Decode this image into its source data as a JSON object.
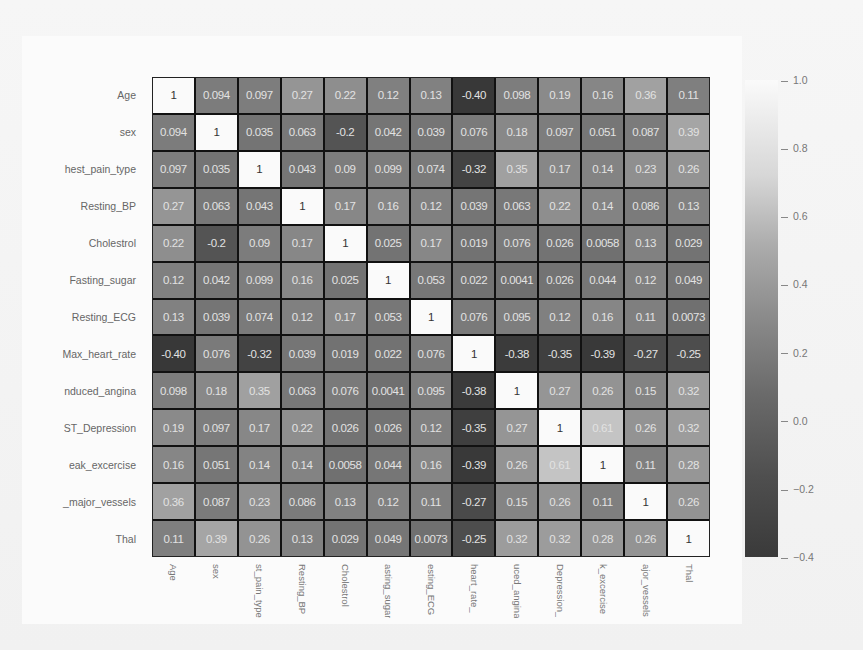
{
  "chart_data": {
    "type": "heatmap",
    "title": "",
    "xlabel": "",
    "ylabel": "",
    "row_labels": [
      "Age",
      "sex",
      "chest_pain_type",
      "Resting_BP",
      "Cholestrol",
      "Fasting_sugar",
      "Resting_ECG",
      "Max_heart_rate",
      "Induced_angina",
      "ST_Depression",
      "Peak_excercise",
      "No_major_vessels",
      "Thal"
    ],
    "row_labels_visible": [
      "Age",
      "sex",
      "hest_pain_type",
      "Resting_BP",
      "Cholestrol",
      "Fasting_sugar",
      "Resting_ECG",
      "Max_heart_rate",
      "nduced_angina",
      "ST_Depression",
      "eak_excercise",
      "_major_vessels",
      "Thal"
    ],
    "col_labels_visible": [
      "Age",
      "sex",
      "st_pain_type",
      "Resting_BP",
      "Cholestrol",
      "asting_sugar",
      "esting_ECG",
      "_heart_rate",
      "uced_angina",
      "_Depression",
      "k_excercise",
      "ajor_vessels",
      "Thal"
    ],
    "values": [
      [
        1,
        0.094,
        0.097,
        0.27,
        0.22,
        0.12,
        0.13,
        -0.4,
        0.098,
        0.19,
        0.16,
        0.36,
        0.11
      ],
      [
        0.094,
        1,
        0.035,
        0.063,
        -0.2,
        0.042,
        0.039,
        0.076,
        0.18,
        0.097,
        0.051,
        0.087,
        0.39
      ],
      [
        0.097,
        0.035,
        1,
        0.043,
        0.09,
        0.099,
        0.074,
        -0.32,
        0.35,
        0.17,
        0.14,
        0.23,
        0.26
      ],
      [
        0.27,
        0.063,
        0.043,
        1,
        0.17,
        0.16,
        0.12,
        0.039,
        0.063,
        0.22,
        0.14,
        0.086,
        0.13
      ],
      [
        0.22,
        -0.2,
        0.09,
        0.17,
        1,
        0.025,
        0.17,
        0.019,
        0.076,
        0.026,
        0.0058,
        0.13,
        0.029
      ],
      [
        0.12,
        0.042,
        0.099,
        0.16,
        0.025,
        1,
        0.053,
        0.022,
        0.0041,
        0.026,
        0.044,
        0.12,
        0.049
      ],
      [
        0.13,
        0.039,
        0.074,
        0.12,
        0.17,
        0.053,
        1,
        0.076,
        0.095,
        0.12,
        0.16,
        0.11,
        0.0073
      ],
      [
        -0.4,
        0.076,
        -0.32,
        0.039,
        0.019,
        0.022,
        0.076,
        1,
        -0.38,
        -0.35,
        -0.39,
        -0.27,
        -0.25
      ],
      [
        0.098,
        0.18,
        0.35,
        0.063,
        0.076,
        0.0041,
        0.095,
        -0.38,
        1,
        0.27,
        0.26,
        0.15,
        0.32
      ],
      [
        0.19,
        0.097,
        0.17,
        0.22,
        0.026,
        0.026,
        0.12,
        -0.35,
        0.27,
        1,
        0.61,
        0.26,
        0.32
      ],
      [
        0.16,
        0.051,
        0.14,
        0.14,
        0.0058,
        0.044,
        0.16,
        -0.39,
        0.26,
        0.61,
        1,
        0.11,
        0.28
      ],
      [
        0.36,
        0.087,
        0.23,
        0.086,
        0.13,
        0.12,
        0.11,
        -0.27,
        0.15,
        0.26,
        0.11,
        1,
        0.26
      ],
      [
        0.11,
        0.39,
        0.26,
        0.13,
        0.029,
        0.049,
        0.0073,
        -0.25,
        0.32,
        0.32,
        0.28,
        0.26,
        1
      ]
    ],
    "display_text": [
      [
        "1",
        "0.094",
        "0.097",
        "0.27",
        "0.22",
        "0.12",
        "0.13",
        "-0.40",
        "0.098",
        "0.19",
        "0.16",
        "0.36",
        "0.11"
      ],
      [
        "0.094",
        "1",
        "0.035",
        "0.063",
        "-0.2",
        "0.042",
        "0.039",
        "0.076",
        "0.18",
        "0.097",
        "0.051",
        "0.087",
        "0.39"
      ],
      [
        "0.097",
        "0.035",
        "1",
        "0.043",
        "0.09",
        "0.099",
        "0.074",
        "-0.32",
        "0.35",
        "0.17",
        "0.14",
        "0.23",
        "0.26"
      ],
      [
        "0.27",
        "0.063",
        "0.043",
        "1",
        "0.17",
        "0.16",
        "0.12",
        "0.039",
        "0.063",
        "0.22",
        "0.14",
        "0.086",
        "0.13"
      ],
      [
        "0.22",
        "-0.2",
        "0.09",
        "0.17",
        "1",
        "0.025",
        "0.17",
        "0.019",
        "0.076",
        "0.026",
        "0.0058",
        "0.13",
        "0.029"
      ],
      [
        "0.12",
        "0.042",
        "0.099",
        "0.16",
        "0.025",
        "1",
        "0.053",
        "0.022",
        "0.0041",
        "0.026",
        "0.044",
        "0.12",
        "0.049"
      ],
      [
        "0.13",
        "0.039",
        "0.074",
        "0.12",
        "0.17",
        "0.053",
        "1",
        "0.076",
        "0.095",
        "0.12",
        "0.16",
        "0.11",
        "0.0073"
      ],
      [
        "-0.40",
        "0.076",
        "-0.32",
        "0.039",
        "0.019",
        "0.022",
        "0.076",
        "1",
        "-0.38",
        "-0.35",
        "-0.39",
        "-0.27",
        "-0.25"
      ],
      [
        "0.098",
        "0.18",
        "0.35",
        "0.063",
        "0.076",
        "0.0041",
        "0.095",
        "-0.38",
        "1",
        "0.27",
        "0.26",
        "0.15",
        "0.32"
      ],
      [
        "0.19",
        "0.097",
        "0.17",
        "0.22",
        "0.026",
        "0.026",
        "0.12",
        "-0.35",
        "0.27",
        "1",
        "0.61",
        "0.26",
        "0.32"
      ],
      [
        "0.16",
        "0.051",
        "0.14",
        "0.14",
        "0.0058",
        "0.044",
        "0.16",
        "-0.39",
        "0.26",
        "0.61",
        "1",
        "0.11",
        "0.28"
      ],
      [
        "0.36",
        "0.087",
        "0.23",
        "0.086",
        "0.13",
        "0.12",
        "0.11",
        "-0.27",
        "0.15",
        "0.26",
        "0.11",
        "1",
        "0.26"
      ],
      [
        "0.11",
        "0.39",
        "0.26",
        "0.13",
        "0.029",
        "0.049",
        "0.0073",
        "-0.25",
        "0.32",
        "0.32",
        "0.28",
        "0.26",
        "1"
      ]
    ],
    "colorbar": {
      "min": -0.4,
      "max": 1.0,
      "ticks": [
        "1.0",
        "0.8",
        "0.6",
        "0.4",
        "0.2",
        "0.0",
        "-0.2",
        "-0.4"
      ],
      "colormap": "grayscale",
      "low_color": "#383838",
      "high_color": "#fafafa"
    },
    "grid": true,
    "annotations": true,
    "legend_position": "right"
  }
}
